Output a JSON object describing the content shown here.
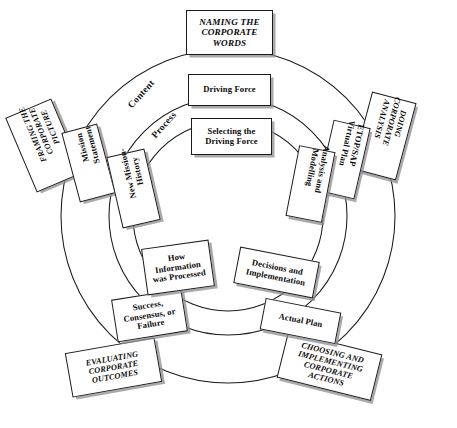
{
  "diagram": {
    "type": "concentric-ring-process",
    "background_color": "#ffffff",
    "line_color": "#1b1b1b",
    "box_fill": "#ffffff",
    "shadow_color": "#8c8c91"
  },
  "ring_labels": [
    {
      "id": "content",
      "label": "Content"
    },
    {
      "id": "process",
      "label": "Process"
    }
  ],
  "rings": {
    "outer": {
      "name": "Outer ring — corporate phases",
      "style": "italic uppercase",
      "nodes": [
        {
          "id": "naming-corporate-words",
          "label": "NAMING THE\nCORPORATE\nWORDS"
        },
        {
          "id": "doing-corporate-analysis",
          "label": "DOING\nCORPORATE\nANALYSIS"
        },
        {
          "id": "choosing-implementing-actions",
          "label": "CHOOSING AND\nIMPLEMENTING\nCORPORATE\nACTIONS"
        },
        {
          "id": "evaluating-corporate-outcomes",
          "label": "EVALUATING\nCORPORATE\nOUTCOMES"
        },
        {
          "id": "framing-corporate-picture",
          "label": "FRAMING THE\nCORPORATE\nPICTURE"
        }
      ]
    },
    "middle": {
      "name": "Middle ring — Content",
      "style": "bold upright",
      "nodes": [
        {
          "id": "driving-force",
          "label": "Driving Force"
        },
        {
          "id": "etop-sap-virtual-plan",
          "label": "ETOP/SAP\nVirtual Plan"
        },
        {
          "id": "actual-plan",
          "label": "Actual Plan"
        },
        {
          "id": "success-consensus-failure",
          "label": "Success,\nConsensus, or\nFailure"
        },
        {
          "id": "mission-statement",
          "label": "Mission\nStatement"
        }
      ]
    },
    "inner": {
      "name": "Inner ring — Process",
      "style": "bold upright",
      "nodes": [
        {
          "id": "selecting-driving-force",
          "label": "Selecting the\nDriving Force"
        },
        {
          "id": "analysis-and-modelling",
          "label": "Analysis and\nModelling"
        },
        {
          "id": "decisions-and-implementation",
          "label": "Decisions and\nImplementation"
        },
        {
          "id": "how-information-was-processed",
          "label": "How\nInformation\nwas Processed"
        },
        {
          "id": "new-mission-history",
          "label": "New Mission-\nHistory"
        }
      ]
    }
  }
}
